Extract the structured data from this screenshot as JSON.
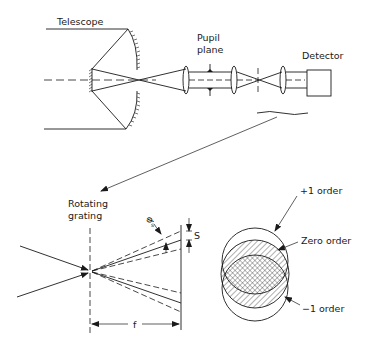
{
  "diagram": {
    "labels": {
      "telescope": "Telescope",
      "pupil_line1": "Pupil",
      "pupil_line2": "plane",
      "detector": "Detector",
      "grating_line1": "Rotating",
      "grating_line2": "grating",
      "phi": "φ",
      "phi_sub": "s",
      "s": "S",
      "f": "f",
      "plus_one": "+1 order",
      "zero": "Zero order",
      "minus_one": "−1 order"
    },
    "colors": {
      "ink": "#1a1a1a",
      "background": "#ffffff"
    }
  }
}
